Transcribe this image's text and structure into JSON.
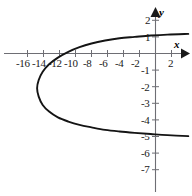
{
  "chart_data": {
    "type": "line",
    "title": "",
    "subtitle": "",
    "xlabel": "x",
    "ylabel": "y",
    "grid": false,
    "legend": "none",
    "xlim": [
      -18.8,
      4.4
    ],
    "ylim": [
      -8.4,
      2.8
    ],
    "x_ticks": [
      -16,
      -14,
      -12,
      -10,
      -8,
      -6,
      -4,
      -2,
      2
    ],
    "x_tick_labels": [
      "-16",
      "-14",
      "-12",
      "-10",
      "-8",
      "-6",
      "-4",
      "-2",
      "2"
    ],
    "y_ticks": [
      2,
      1,
      -1,
      -2,
      -3,
      -4,
      -5,
      -6,
      -7
    ],
    "y_tick_labels": [
      "2",
      "1",
      "-1",
      "-2",
      "-3",
      "-4",
      "-5",
      "-6",
      "-7"
    ],
    "vertex": [
      -14.8,
      -2.1
    ],
    "axis_of_symmetry": -2.1,
    "x_intercept": -8.5,
    "y_intercepts": [
      0.85,
      -4.85
    ],
    "series": [
      {
        "name": "parabola-upper-branch",
        "points": [
          [
            -14.8,
            -2.1
          ],
          [
            -14.6,
            -1.6
          ],
          [
            -14.1,
            -1.1
          ],
          [
            -13.3,
            -0.65
          ],
          [
            -12.2,
            -0.25
          ],
          [
            -10.9,
            0.1
          ],
          [
            -9.5,
            0.38
          ],
          [
            -8.0,
            0.6
          ],
          [
            -6.3,
            0.78
          ],
          [
            -4.5,
            0.92
          ],
          [
            -2.6,
            1.0
          ],
          [
            -0.6,
            1.08
          ],
          [
            1.5,
            1.14
          ],
          [
            4.1,
            1.18
          ]
        ]
      },
      {
        "name": "parabola-lower-branch",
        "points": [
          [
            -14.8,
            -2.1
          ],
          [
            -14.6,
            -2.6
          ],
          [
            -14.1,
            -3.1
          ],
          [
            -13.3,
            -3.5
          ],
          [
            -12.2,
            -3.85
          ],
          [
            -10.9,
            -4.1
          ],
          [
            -9.5,
            -4.3
          ],
          [
            -8.0,
            -4.45
          ],
          [
            -6.3,
            -4.6
          ],
          [
            -4.5,
            -4.7
          ],
          [
            -2.6,
            -4.78
          ],
          [
            -0.6,
            -4.85
          ],
          [
            1.5,
            -4.92
          ],
          [
            4.1,
            -4.98
          ]
        ]
      }
    ]
  },
  "axes": {
    "x_axis_name": "x",
    "y_axis_name": "y"
  }
}
